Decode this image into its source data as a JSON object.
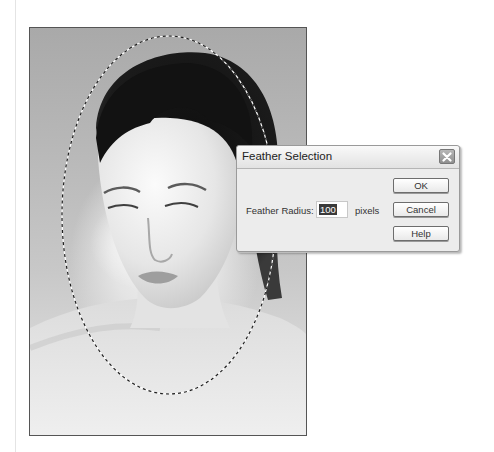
{
  "photo": {
    "description": "grayscale portrait of a woman with dark hair, head tilted down",
    "selection": {
      "shape": "ellipse",
      "style": "marching-ants dashed outline"
    }
  },
  "dialog": {
    "title": "Feather Selection",
    "close_icon": "close-x-icon",
    "fields": {
      "feather_radius": {
        "label": "Feather Radius:",
        "value": "100",
        "unit": "pixels"
      }
    },
    "buttons": {
      "ok": "OK",
      "cancel": "Cancel",
      "help": "Help"
    }
  },
  "colors": {
    "dialog_bg": "#ececec",
    "button_border": "#6d6d6d",
    "selected_text_bg": "#3a3a3a"
  }
}
